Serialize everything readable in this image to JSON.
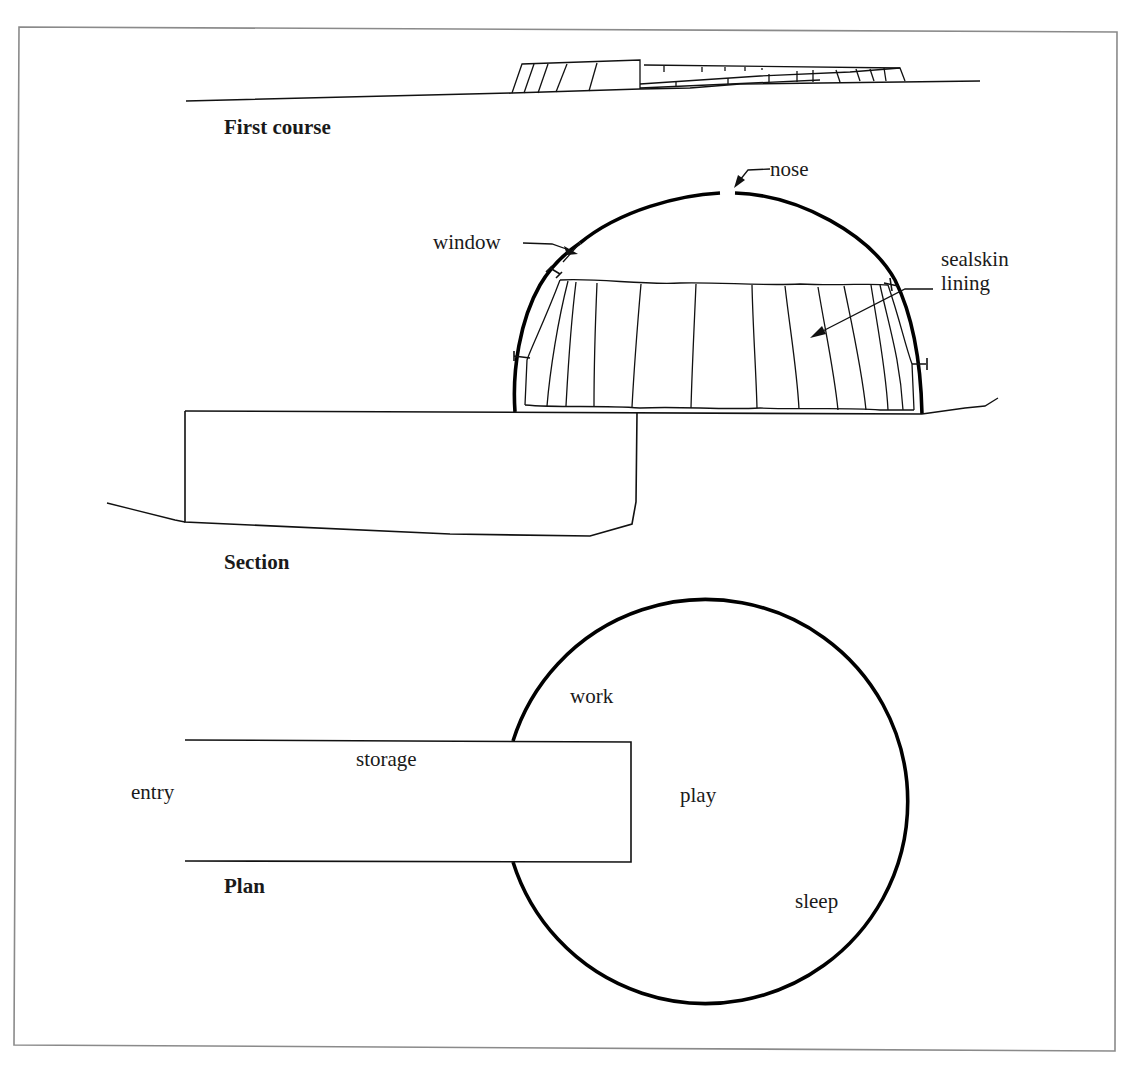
{
  "figure": {
    "frame_color": "#8a8a8a",
    "ink_color": "#111111",
    "panels": {
      "first_course": {
        "title": "First course"
      },
      "section": {
        "title": "Section",
        "annotations": {
          "nose": "nose",
          "window": "window",
          "lining_line1": "sealskin",
          "lining_line2": "lining"
        }
      },
      "plan": {
        "title": "Plan",
        "rooms": {
          "work": "work",
          "storage": "storage",
          "entry": "entry",
          "play": "play",
          "sleep": "sleep"
        }
      }
    }
  }
}
